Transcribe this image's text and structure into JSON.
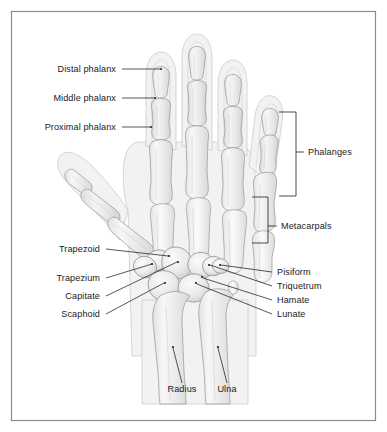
{
  "figure": {
    "view": "Dorsal (posterior) view of the right hand skeleton",
    "background_color": "#ffffff",
    "frame_color": "#8d8d8d",
    "label_color": "#1a1a1a",
    "leader_color": "#2b2b2b",
    "bone_fill_color": "#ededed",
    "soft_tissue_color": "#f2f2f2"
  },
  "labels_left": [
    {
      "id": "distal-phalanx",
      "text": "Distal phalanx",
      "x": 116,
      "y": 72,
      "target_x": 161,
      "target_y": 74
    },
    {
      "id": "middle-phalanx",
      "text": "Middle phalanx",
      "x": 116,
      "y": 101,
      "target_x": 155,
      "target_y": 103
    },
    {
      "id": "proximal-phalanx",
      "text": "Proximal phalanx",
      "x": 116,
      "y": 130,
      "target_x": 151,
      "target_y": 132
    },
    {
      "id": "trapezoid",
      "text": "Trapezoid",
      "x": 100,
      "y": 252,
      "target_x": 169,
      "target_y": 259
    },
    {
      "id": "trapezium",
      "text": "Trapezium",
      "x": 100,
      "y": 281,
      "target_x": 152,
      "target_y": 264
    },
    {
      "id": "capitate",
      "text": "Capitate",
      "x": 100,
      "y": 299,
      "target_x": 178,
      "target_y": 264
    },
    {
      "id": "scaphoid",
      "text": "Scaphoid",
      "x": 100,
      "y": 317,
      "target_x": 165,
      "target_y": 284
    }
  ],
  "labels_right": [
    {
      "id": "pisiform",
      "text": "Pisiform",
      "x": 277,
      "y": 275,
      "target_x": 219,
      "target_y": 267
    },
    {
      "id": "triquetrum",
      "text": "Triquetrum",
      "x": 277,
      "y": 289,
      "target_x": 209,
      "target_y": 268
    },
    {
      "id": "hamate",
      "text": "Hamate",
      "x": 277,
      "y": 303,
      "target_x": 202,
      "target_y": 281
    },
    {
      "id": "lunate",
      "text": "Lunate",
      "x": 277,
      "y": 317,
      "target_x": 196,
      "target_y": 285
    }
  ],
  "labels_bottom": [
    {
      "id": "radius",
      "text": "Radius",
      "x": 182,
      "y": 392,
      "target_x": 173,
      "target_y": 347
    },
    {
      "id": "ulna",
      "text": "Ulna",
      "x": 227,
      "y": 392,
      "target_x": 218,
      "target_y": 347
    }
  ],
  "brackets": [
    {
      "id": "phalanges",
      "text": "Phalanges",
      "label_x": 310,
      "label_y": 155,
      "spine_x": 296,
      "top_y": 112,
      "bottom_y": 196,
      "tick_y": 152,
      "tick_to_x": 304,
      "arm_top_to_x": 279,
      "arm_bottom_to_x": 279
    },
    {
      "id": "metacarpals",
      "text": "Metacarpals",
      "label_x": 283,
      "label_y": 229,
      "spine_x": 268,
      "top_y": 197,
      "bottom_y": 243,
      "tick_y": 226,
      "tick_to_x": 277,
      "arm_top_to_x": 252,
      "arm_bottom_to_x": 252
    }
  ],
  "bone_groups": {
    "phalanges_count_per_finger": 3,
    "thumb_phalanges_count": 2,
    "metacarpals_count": 5,
    "carpals": [
      "Scaphoid",
      "Lunate",
      "Triquetrum",
      "Pisiform",
      "Trapezium",
      "Trapezoid",
      "Capitate",
      "Hamate"
    ],
    "forearm_bones": [
      "Radius",
      "Ulna"
    ]
  }
}
